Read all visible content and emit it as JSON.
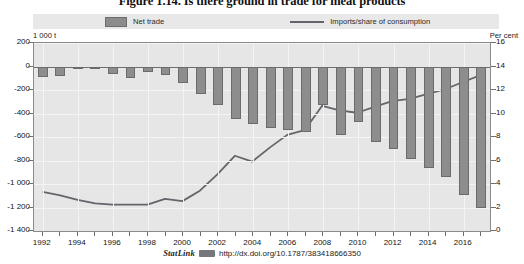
{
  "title": "Figure 1.14. Is there ground in trade for meat products",
  "legend": {
    "bar_label": "Net trade",
    "line_label": "Imports/share of consumption"
  },
  "axes": {
    "unit_left": "1 000 t",
    "unit_right": "Per cent",
    "left_ticks": [
      "200",
      "0",
      "-200",
      "-400",
      "-600",
      "-800",
      "-1 000",
      "-1 200",
      "-1 400"
    ],
    "right_ticks": [
      "16",
      "14",
      "12",
      "10",
      "8",
      "6",
      "4",
      "2",
      "0"
    ],
    "x_ticks": [
      "1992",
      "1994",
      "1996",
      "1998",
      "2000",
      "2002",
      "2004",
      "2006",
      "2008",
      "2010",
      "2012",
      "2014",
      "2016"
    ]
  },
  "footer": {
    "statlink": "StatLink",
    "glyph": "statlink-glyph-icon",
    "url": "http://dx.doi.org/10.1787/383418666350"
  },
  "colors": {
    "bar_fill": "#8d8d8d",
    "bar_stroke": "#6b6b6b",
    "line": "#63656a",
    "plot_background": "#e6e6e6",
    "legend_background": "#e8e8e8",
    "grid": "#f4f4f4"
  },
  "chart_data": {
    "type": "bar",
    "title": "Figure 1.14. Is there ground in trade for meat products",
    "xlabel": "",
    "ylabel": "1 000 t",
    "ylabel_right": "Per cent",
    "ylim": [
      -1400,
      200
    ],
    "ylim_right": [
      0,
      16
    ],
    "grid": true,
    "legend_position": "top",
    "categories": [
      1992,
      1993,
      1994,
      1995,
      1996,
      1997,
      1998,
      1999,
      2000,
      2001,
      2002,
      2003,
      2004,
      2005,
      2006,
      2007,
      2008,
      2009,
      2010,
      2011,
      2012,
      2013,
      2014,
      2015,
      2016,
      2017
    ],
    "series": [
      {
        "name": "Net trade",
        "type": "bar",
        "axis": "left",
        "unit": "1 000 t",
        "values": [
          -90,
          -80,
          -20,
          -10,
          -60,
          -95,
          -45,
          -75,
          -140,
          -230,
          -330,
          -450,
          -490,
          -520,
          -540,
          -560,
          -330,
          -580,
          -470,
          -640,
          -700,
          -790,
          -860,
          -940,
          -1090,
          -1200
        ]
      },
      {
        "name": "Imports/share of consumption",
        "type": "line",
        "axis": "right",
        "unit": "Per cent",
        "values": [
          3.2,
          2.9,
          2.5,
          2.2,
          2.1,
          2.1,
          2.1,
          2.6,
          2.4,
          3.3,
          4.7,
          6.3,
          5.8,
          7.0,
          8.1,
          8.5,
          10.6,
          10.2,
          10.0,
          10.5,
          11.0,
          11.2,
          11.6,
          12.0,
          12.6,
          13.2
        ]
      }
    ]
  }
}
